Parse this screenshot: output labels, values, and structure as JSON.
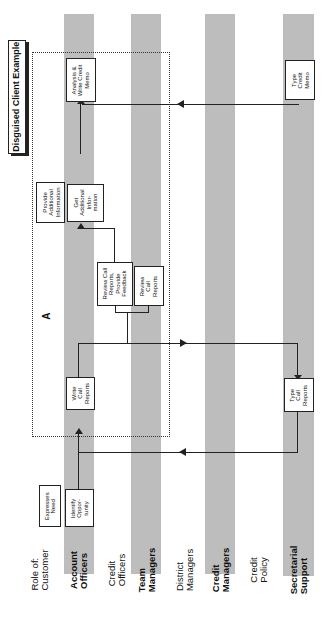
{
  "title": "Disguised Client Example",
  "region_label": "A",
  "roles": [
    {
      "label": "Role of:\nCustomer",
      "shaded": false
    },
    {
      "label": "Account\nOfficers",
      "shaded": true
    },
    {
      "label": "Credit\nOfficers",
      "shaded": false
    },
    {
      "label": "Team\nManagers",
      "shaded": true
    },
    {
      "label": "District\nManagers",
      "shaded": false
    },
    {
      "label": "Credit\nManagers",
      "shaded": true
    },
    {
      "label": "Credit\nPolicy",
      "shaded": false
    },
    {
      "label": "Secretarial\nSupport",
      "shaded": true
    }
  ],
  "steps": {
    "expresses_need": "Expresses\nNeed",
    "identify_opportunity": "Identify\nOppor-\ntunity",
    "write_call_reports": "Write\nCall\nReports",
    "type_call_reports": "Type\nCall\nReports",
    "review_call_reports_feedback": "Review Call\nReports,\nProvide\nFeedback",
    "review_call_reports": "Review\nCall\nReports",
    "get_additional_information": "Get\nAdditional\nInfor-\nmation",
    "provide_additional_information": "Provide\nAdditional\nInformation",
    "analysis_write_credit_memo": "Analysis &\nWrite Credit\nMemo",
    "type_credit_memo": "Type\nCredit\nMemo"
  },
  "colors": {
    "lane": "#bdbdbd",
    "line": "#222222"
  }
}
